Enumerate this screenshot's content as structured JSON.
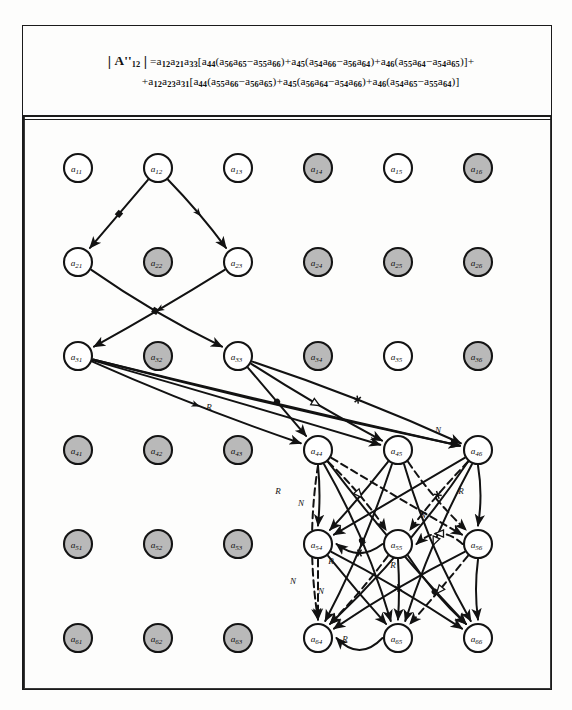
{
  "document": {
    "type": "signal-flow-graph-figure",
    "formula": {
      "line1_plain": "| A''12 | = a12 a21 a33 [ a44 ( a56 a65 − a55 a66 ) + a45 ( a54 a66 − a56 a64 ) + a46 ( a55 a64 − a54 a65 ) ] +",
      "line2_plain": "+ a12 a23 a31 [ a44 ( a55 a66 − a56 a65 ) + a45 ( a56 a64 − a54 a66 ) + a46 ( a54 a65 − a55 a64 ) ]",
      "determinant_symbol": "A''",
      "determinant_subscript": "12",
      "terms_line1": [
        {
          "coef": [
            "a12",
            "a21",
            "a33"
          ],
          "bracket": [
            {
              "lead": "a44",
              "pair1": [
                "a56",
                "a65"
              ],
              "op": "−",
              "pair2": [
                "a55",
                "a66"
              ]
            },
            {
              "lead": "a45",
              "pair1": [
                "a54",
                "a66"
              ],
              "op": "−",
              "pair2": [
                "a56",
                "a64"
              ]
            },
            {
              "lead": "a46",
              "pair1": [
                "a55",
                "a64"
              ],
              "op": "−",
              "pair2": [
                "a54",
                "a65"
              ]
            }
          ]
        }
      ],
      "terms_line2": [
        {
          "coef": [
            "a12",
            "a23",
            "a31"
          ],
          "bracket": [
            {
              "lead": "a44",
              "pair1": [
                "a55",
                "a66"
              ],
              "op": "−",
              "pair2": [
                "a56",
                "a65"
              ]
            },
            {
              "lead": "a45",
              "pair1": [
                "a56",
                "a64"
              ],
              "op": "−",
              "pair2": [
                "a54",
                "a66"
              ]
            },
            {
              "lead": "a46",
              "pair1": [
                "a54",
                "a65"
              ],
              "op": "−",
              "pair2": [
                "a55",
                "a64"
              ]
            }
          ]
        }
      ]
    }
  },
  "graph_data": {
    "type": "diagram",
    "grid": {
      "rows": 6,
      "cols": 6,
      "x0": 55,
      "dx": 80,
      "y0": 50,
      "dy": 94,
      "radius": 14
    },
    "nodes": [
      {
        "id": "a11",
        "label": "a",
        "sub": "11",
        "row": 1,
        "col": 1,
        "x": 55,
        "y": 50,
        "shaded": false
      },
      {
        "id": "a12",
        "label": "a",
        "sub": "12",
        "row": 1,
        "col": 2,
        "x": 135,
        "y": 50,
        "shaded": false
      },
      {
        "id": "a13",
        "label": "a",
        "sub": "13",
        "row": 1,
        "col": 3,
        "x": 215,
        "y": 50,
        "shaded": false
      },
      {
        "id": "a14",
        "label": "a",
        "sub": "14",
        "row": 1,
        "col": 4,
        "x": 295,
        "y": 50,
        "shaded": true
      },
      {
        "id": "a15",
        "label": "a",
        "sub": "15",
        "row": 1,
        "col": 5,
        "x": 375,
        "y": 50,
        "shaded": false
      },
      {
        "id": "a16",
        "label": "a",
        "sub": "16",
        "row": 1,
        "col": 6,
        "x": 455,
        "y": 50,
        "shaded": true
      },
      {
        "id": "a21",
        "label": "a",
        "sub": "21",
        "row": 2,
        "col": 1,
        "x": 55,
        "y": 144,
        "shaded": false
      },
      {
        "id": "a22",
        "label": "a",
        "sub": "22",
        "row": 2,
        "col": 2,
        "x": 135,
        "y": 144,
        "shaded": true
      },
      {
        "id": "a23",
        "label": "a",
        "sub": "23",
        "row": 2,
        "col": 3,
        "x": 215,
        "y": 144,
        "shaded": false
      },
      {
        "id": "a24",
        "label": "a",
        "sub": "24",
        "row": 2,
        "col": 4,
        "x": 295,
        "y": 144,
        "shaded": true
      },
      {
        "id": "a25",
        "label": "a",
        "sub": "25",
        "row": 2,
        "col": 5,
        "x": 375,
        "y": 144,
        "shaded": true
      },
      {
        "id": "a26",
        "label": "a",
        "sub": "26",
        "row": 2,
        "col": 6,
        "x": 455,
        "y": 144,
        "shaded": true
      },
      {
        "id": "a31",
        "label": "a",
        "sub": "31",
        "row": 3,
        "col": 1,
        "x": 55,
        "y": 238,
        "shaded": false
      },
      {
        "id": "a32",
        "label": "a",
        "sub": "32",
        "row": 3,
        "col": 2,
        "x": 135,
        "y": 238,
        "shaded": true
      },
      {
        "id": "a33",
        "label": "a",
        "sub": "33",
        "row": 3,
        "col": 3,
        "x": 215,
        "y": 238,
        "shaded": false
      },
      {
        "id": "a34",
        "label": "a",
        "sub": "34",
        "row": 3,
        "col": 4,
        "x": 295,
        "y": 238,
        "shaded": true
      },
      {
        "id": "a35",
        "label": "a",
        "sub": "35",
        "row": 3,
        "col": 5,
        "x": 375,
        "y": 238,
        "shaded": false
      },
      {
        "id": "a36",
        "label": "a",
        "sub": "36",
        "row": 3,
        "col": 6,
        "x": 455,
        "y": 238,
        "shaded": true
      },
      {
        "id": "a41",
        "label": "a",
        "sub": "41",
        "row": 4,
        "col": 1,
        "x": 55,
        "y": 332,
        "shaded": true
      },
      {
        "id": "a42",
        "label": "a",
        "sub": "42",
        "row": 4,
        "col": 2,
        "x": 135,
        "y": 332,
        "shaded": true
      },
      {
        "id": "a43",
        "label": "a",
        "sub": "43",
        "row": 4,
        "col": 3,
        "x": 215,
        "y": 332,
        "shaded": true
      },
      {
        "id": "a44",
        "label": "a",
        "sub": "44",
        "row": 4,
        "col": 4,
        "x": 295,
        "y": 332,
        "shaded": false
      },
      {
        "id": "a45",
        "label": "a",
        "sub": "45",
        "row": 4,
        "col": 5,
        "x": 375,
        "y": 332,
        "shaded": false
      },
      {
        "id": "a46",
        "label": "a",
        "sub": "46",
        "row": 4,
        "col": 6,
        "x": 455,
        "y": 332,
        "shaded": false
      },
      {
        "id": "a51",
        "label": "a",
        "sub": "51",
        "row": 5,
        "col": 1,
        "x": 55,
        "y": 426,
        "shaded": true
      },
      {
        "id": "a52",
        "label": "a",
        "sub": "52",
        "row": 5,
        "col": 2,
        "x": 135,
        "y": 426,
        "shaded": true
      },
      {
        "id": "a53",
        "label": "a",
        "sub": "53",
        "row": 5,
        "col": 3,
        "x": 215,
        "y": 426,
        "shaded": true
      },
      {
        "id": "a54",
        "label": "a",
        "sub": "54",
        "row": 5,
        "col": 4,
        "x": 295,
        "y": 426,
        "shaded": false
      },
      {
        "id": "a55",
        "label": "a",
        "sub": "55",
        "row": 5,
        "col": 5,
        "x": 375,
        "y": 426,
        "shaded": false
      },
      {
        "id": "a56",
        "label": "a",
        "sub": "56",
        "row": 5,
        "col": 6,
        "x": 455,
        "y": 426,
        "shaded": false
      },
      {
        "id": "a61",
        "label": "a",
        "sub": "61",
        "row": 6,
        "col": 1,
        "x": 55,
        "y": 520,
        "shaded": true
      },
      {
        "id": "a62",
        "label": "a",
        "sub": "62",
        "row": 6,
        "col": 2,
        "x": 135,
        "y": 520,
        "shaded": true
      },
      {
        "id": "a63",
        "label": "a",
        "sub": "63",
        "row": 6,
        "col": 3,
        "x": 215,
        "y": 520,
        "shaded": true
      },
      {
        "id": "a64",
        "label": "a",
        "sub": "64",
        "row": 6,
        "col": 4,
        "x": 295,
        "y": 520,
        "shaded": false
      },
      {
        "id": "a65",
        "label": "a",
        "sub": "65",
        "row": 6,
        "col": 5,
        "x": 375,
        "y": 520,
        "shaded": false
      },
      {
        "id": "a66",
        "label": "a",
        "sub": "66",
        "row": 6,
        "col": 6,
        "x": 455,
        "y": 520,
        "shaded": false
      }
    ],
    "edges": [
      {
        "from": "a12",
        "to": "a21",
        "style": "solid",
        "mid": "square"
      },
      {
        "from": "a12",
        "to": "a23",
        "style": "solid",
        "mid": "arrow"
      },
      {
        "from": "a21",
        "to": "a33",
        "style": "solid",
        "mid": "square"
      },
      {
        "from": "a23",
        "to": "a31",
        "style": "solid",
        "mid": "arrow"
      },
      {
        "from": "a31",
        "to": "a44",
        "style": "solid",
        "mid": "arrow"
      },
      {
        "from": "a31",
        "to": "a45",
        "style": "solid",
        "mid": "none"
      },
      {
        "from": "a31",
        "to": "a46",
        "style": "solid",
        "mid": "none",
        "label": "N"
      },
      {
        "from": "a33",
        "to": "a44",
        "style": "solid",
        "mid": "circle"
      },
      {
        "from": "a33",
        "to": "a45",
        "style": "solid",
        "mid": "triangle"
      },
      {
        "from": "a33",
        "to": "a46",
        "style": "solid",
        "mid": "star"
      },
      {
        "from": "a31",
        "to": "a46",
        "style": "solid",
        "mid": "none",
        "label": "R",
        "variant": "low"
      },
      {
        "from": "a44",
        "to": "a55",
        "style": "dashed",
        "mid": "triangle"
      },
      {
        "from": "a44",
        "to": "a56",
        "style": "dashed",
        "mid": "none"
      },
      {
        "from": "a44",
        "to": "a65",
        "style": "solid",
        "mid": "circle"
      },
      {
        "from": "a44",
        "to": "a66",
        "style": "solid",
        "mid": "none"
      },
      {
        "from": "a44",
        "to": "a54",
        "style": "solid",
        "mid": "none",
        "label": "R"
      },
      {
        "from": "a44",
        "to": "a64",
        "style": "dashed",
        "mid": "none",
        "label": "N"
      },
      {
        "from": "a45",
        "to": "a54",
        "style": "solid",
        "mid": "none"
      },
      {
        "from": "a45",
        "to": "a56",
        "style": "dashed",
        "mid": "none"
      },
      {
        "from": "a45",
        "to": "a64",
        "style": "solid",
        "mid": "arrow"
      },
      {
        "from": "a45",
        "to": "a66",
        "style": "solid",
        "mid": "none"
      },
      {
        "from": "a46",
        "to": "a54",
        "style": "solid",
        "mid": "none"
      },
      {
        "from": "a46",
        "to": "a55",
        "style": "dashed",
        "mid": "star"
      },
      {
        "from": "a46",
        "to": "a64",
        "style": "solid",
        "mid": "none"
      },
      {
        "from": "a46",
        "to": "a65",
        "style": "solid",
        "mid": "triangle"
      },
      {
        "from": "a46",
        "to": "a56",
        "style": "solid",
        "mid": "none",
        "label": "R"
      },
      {
        "from": "a54",
        "to": "a65",
        "style": "solid",
        "mid": "none"
      },
      {
        "from": "a54",
        "to": "a66",
        "style": "solid",
        "mid": "none"
      },
      {
        "from": "a54",
        "to": "a64",
        "style": "dashed",
        "mid": "none",
        "label": "N"
      },
      {
        "from": "a55",
        "to": "a64",
        "style": "dashed",
        "mid": "none",
        "label": "R"
      },
      {
        "from": "a55",
        "to": "a66",
        "style": "solid",
        "mid": "circle"
      },
      {
        "from": "a55",
        "to": "a65",
        "style": "solid",
        "mid": "none"
      },
      {
        "from": "a56",
        "to": "a64",
        "style": "solid",
        "mid": "star"
      },
      {
        "from": "a56",
        "to": "a65",
        "style": "dashed",
        "mid": "triangle"
      },
      {
        "from": "a56",
        "to": "a66",
        "style": "solid",
        "mid": "none"
      },
      {
        "from": "a55",
        "to": "a54",
        "style": "solid",
        "mid": "star"
      },
      {
        "from": "a56",
        "to": "a55",
        "style": "dashed",
        "mid": "triangle"
      },
      {
        "from": "a65",
        "to": "a64",
        "style": "solid",
        "mid": "none",
        "label": "R"
      }
    ],
    "edge_labels": [
      {
        "text": "R",
        "x": 186,
        "y": 289
      },
      {
        "text": "N",
        "x": 415,
        "y": 312
      },
      {
        "text": "R",
        "x": 255,
        "y": 373
      },
      {
        "text": "N",
        "x": 278,
        "y": 385
      },
      {
        "text": "R",
        "x": 438,
        "y": 373
      },
      {
        "text": "N",
        "x": 400,
        "y": 397
      },
      {
        "text": "R",
        "x": 308,
        "y": 443
      },
      {
        "text": "N",
        "x": 270,
        "y": 463
      },
      {
        "text": "R",
        "x": 370,
        "y": 447
      },
      {
        "text": "N",
        "x": 298,
        "y": 473
      },
      {
        "text": "R",
        "x": 322,
        "y": 521
      }
    ]
  }
}
